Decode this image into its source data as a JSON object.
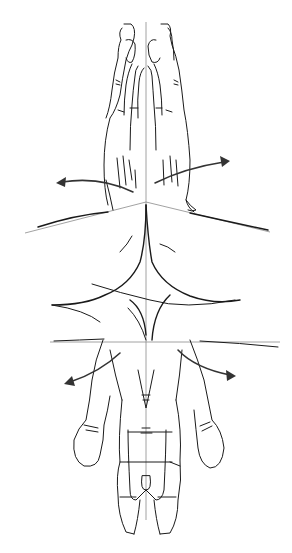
{
  "figure": {
    "kind": "line-art illustration",
    "subject": "hands rotating about a central axis (prayer hands above, open palm below)",
    "colors": {
      "background": "#ffffff",
      "ink": "#1a1a1a",
      "guide_line": "#8a8a8a",
      "arrow": "#333333"
    },
    "elements": {
      "top_hands": "two hands pressed together, fingertips up",
      "bottom_hand": "hand seen palm side, fingers down, thumbs out to sides",
      "guides": [
        "vertical center axis",
        "upper horizontal plane line",
        "lower horizontal plane line"
      ],
      "arrows": [
        "upper-left rotation arrow",
        "upper-right rotation arrow",
        "lower-left rotation arrow",
        "lower-right rotation arrow"
      ]
    }
  }
}
